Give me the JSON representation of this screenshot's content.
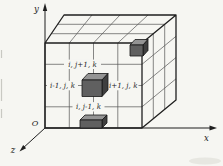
{
  "diagram": {
    "axes": {
      "x_label": "x",
      "y_label": "y",
      "z_label": "z",
      "origin_label": "O"
    },
    "node_labels": {
      "north": "i, j+1, k",
      "west": "i-1, j, k",
      "east": "i+1, j, k",
      "south": "i, j-1, k"
    },
    "grid": {
      "columns": 4,
      "rows": 4,
      "depth_divisions": 3
    },
    "colors": {
      "paper": "#f6f6f2",
      "edge": "#1f1f1f",
      "grid_line": "#555555",
      "cube_top": "#949494",
      "cube_front": "#606060",
      "cube_side": "#3f3f3f"
    }
  }
}
